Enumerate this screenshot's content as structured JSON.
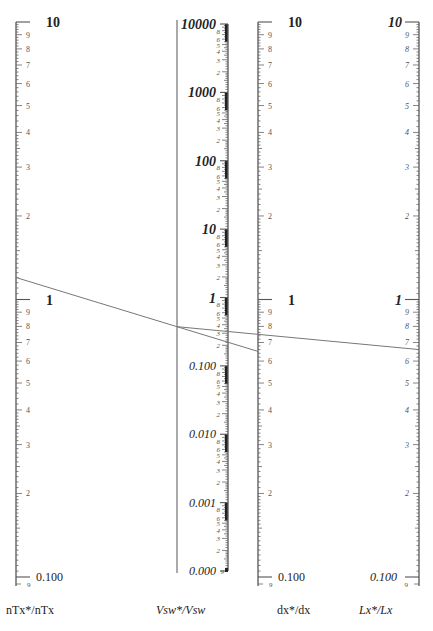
{
  "chart_data": {
    "type": "nomogram",
    "title": "",
    "scale": "logarithmic",
    "axes": [
      {
        "id": "nTx",
        "label": "nTx*/nTx",
        "italic": false,
        "range": [
          0.1,
          10
        ],
        "decade_labels": [
          "10",
          "1",
          "0.100"
        ],
        "minor_labels": [
          "9",
          "8",
          "7",
          "6",
          "5",
          "4",
          "3",
          "2"
        ],
        "tick_side": "right"
      },
      {
        "id": "Vsw",
        "label": "Vsw*/Vsw",
        "italic": true,
        "range": [
          0.0001,
          10000
        ],
        "decade_labels": [
          "10000",
          "1000",
          "100",
          "10",
          "1",
          "0.100",
          "0.010",
          "0.001",
          "0.000"
        ],
        "minor_labels": [
          "8",
          "6",
          "5",
          "4",
          "3",
          "2"
        ],
        "tick_side": "left"
      },
      {
        "id": "dx",
        "label": "dx*/dx",
        "italic": false,
        "range": [
          0.1,
          10
        ],
        "decade_labels": [
          "10",
          "1",
          "0.100"
        ],
        "minor_labels": [
          "9",
          "8",
          "7",
          "6",
          "5",
          "4",
          "3",
          "2"
        ],
        "tick_side": "right"
      },
      {
        "id": "Lx",
        "label": "Lx*/Lx",
        "italic": true,
        "range": [
          0.1,
          10
        ],
        "decade_labels": [
          "10",
          "1",
          "0.100"
        ],
        "minor_labels": [
          "9",
          "8",
          "7",
          "6",
          "5",
          "4",
          "3",
          "2"
        ],
        "tick_side": "left"
      }
    ],
    "isopleths": [
      {
        "from_axis": "nTx",
        "from_value": 1.2,
        "to_axis": "dx",
        "to_value": 0.65,
        "pivot_axis": "Vsw",
        "pivot_value": 0.37
      },
      {
        "from_axis": "Vsw",
        "from_value": 0.37,
        "to_axis": "Lx",
        "to_value": 0.66
      }
    ],
    "grid": false,
    "legend": null
  },
  "labels": {
    "nTx": "nTx*/nTx",
    "Vsw": "Vsw*/Vsw",
    "dx": "dx*/dx",
    "Lx": "Lx*/Lx"
  },
  "colors": {
    "axis": "#555555",
    "ticks": "#666666",
    "text": "#222222",
    "isopleth": "#777777"
  }
}
